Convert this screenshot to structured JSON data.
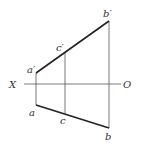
{
  "diagram": {
    "type": "orthographic projection of a line",
    "axis": {
      "left_label": "X",
      "right_label": "O"
    },
    "points": {
      "a_prime": {
        "label": "a′"
      },
      "b_prime": {
        "label": "b′"
      },
      "c_prime": {
        "label": "c′"
      },
      "a": {
        "label": "a"
      },
      "b": {
        "label": "b"
      },
      "c": {
        "label": "c"
      }
    },
    "colors": {
      "line": "#222222",
      "thin": "#555555",
      "label": "#333333"
    }
  }
}
